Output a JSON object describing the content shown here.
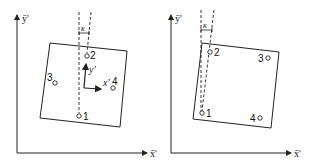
{
  "panels": [
    {
      "id": "left",
      "axes": {
        "x_label": "x̄'",
        "y_label": "ȳ'"
      },
      "angle_label": "κ",
      "local_axes": {
        "x_label": "x'",
        "y_label": "y'"
      },
      "points": [
        {
          "label": "1"
        },
        {
          "label": "2"
        },
        {
          "label": "3"
        },
        {
          "label": "4"
        }
      ]
    },
    {
      "id": "right",
      "axes": {
        "x_label": "x̄'",
        "y_label": "ȳ'"
      },
      "angle_label": "κ",
      "points": [
        {
          "label": "1"
        },
        {
          "label": "2"
        },
        {
          "label": "3"
        },
        {
          "label": "4"
        }
      ]
    }
  ],
  "colors": {
    "stroke": "#222222",
    "background": "#ffffff"
  }
}
